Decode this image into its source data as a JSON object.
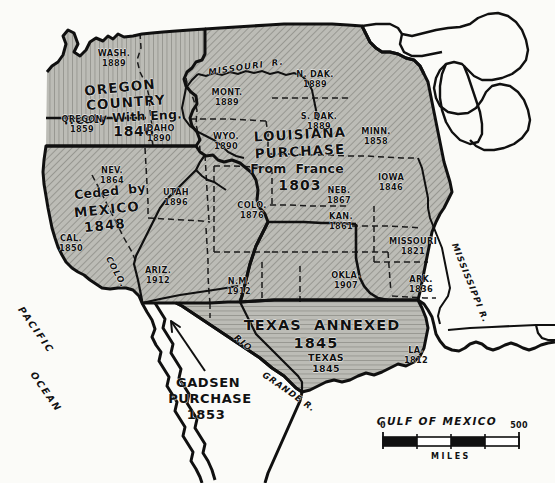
{
  "map": {
    "title": "United States Territorial Expansion",
    "colors": {
      "ink": "#111111",
      "paper": "#fdfdfb",
      "land_fill": "#b9b9b4",
      "ocean_fill": "#f4f4f0"
    },
    "territories": [
      {
        "id": "oregon-country",
        "lines": [
          "OREGON",
          "COUNTRY"
        ],
        "sub": "Treaty With Eng.",
        "year": "1846"
      },
      {
        "id": "mexican-cession",
        "lines": [
          "Ceded  by",
          "MEXICO"
        ],
        "year": "1848"
      },
      {
        "id": "louisiana-purchase",
        "lines": [
          "LOUISIANA",
          "PURCHASE"
        ],
        "sub": "From  France",
        "year": "1803"
      },
      {
        "id": "texas-annexation",
        "lines": [
          "TEXAS  ANNEXED"
        ],
        "year": "1845"
      },
      {
        "id": "gadsden-purchase",
        "lines": [
          "GADSEN",
          "PURCHASE"
        ],
        "year": "1853"
      }
    ],
    "states": [
      {
        "id": "wash",
        "name": "WASH.",
        "year": "1889",
        "x": 114,
        "y": 57
      },
      {
        "id": "oregon",
        "name": "OREGON",
        "year": "1859",
        "x": 82,
        "y": 123
      },
      {
        "id": "idaho",
        "name": "IDAHO",
        "year": "1890",
        "x": 158,
        "y": 130
      },
      {
        "id": "mont",
        "name": "MONT.",
        "year": "1889",
        "x": 226,
        "y": 95
      },
      {
        "id": "wyo",
        "name": "WYO.",
        "year": "1890",
        "x": 225,
        "y": 139
      },
      {
        "id": "ndak",
        "name": "N. DAK.",
        "year": "1889",
        "x": 314,
        "y": 78
      },
      {
        "id": "sdak",
        "name": "S. DAK.",
        "year": "1889",
        "x": 318,
        "y": 118
      },
      {
        "id": "minn",
        "name": "MINN.",
        "year": "1858",
        "x": 375,
        "y": 133
      },
      {
        "id": "iowa",
        "name": "IOWA",
        "year": "1846",
        "x": 390,
        "y": 180
      },
      {
        "id": "neb",
        "name": "NEB.",
        "year": "1867",
        "x": 338,
        "y": 193
      },
      {
        "id": "kan",
        "name": "KAN.",
        "year": "1861",
        "x": 340,
        "y": 218
      },
      {
        "id": "colo",
        "name": "COLO.",
        "year": "1876",
        "x": 251,
        "y": 207
      },
      {
        "id": "nev",
        "name": "NEV.",
        "year": "1864",
        "x": 111,
        "y": 172
      },
      {
        "id": "utah",
        "name": "UTAH",
        "year": "1896",
        "x": 175,
        "y": 194
      },
      {
        "id": "cal",
        "name": "CAL.",
        "year": "1850",
        "x": 70,
        "y": 240
      },
      {
        "id": "ariz",
        "name": "ARIZ.",
        "year": "1912",
        "x": 157,
        "y": 273
      },
      {
        "id": "nm",
        "name": "N.M.",
        "year": "1912",
        "x": 238,
        "y": 283
      },
      {
        "id": "okla",
        "name": "OKLA.",
        "year": "1907",
        "x": 345,
        "y": 277
      },
      {
        "id": "missouri",
        "name": "MISSOURI",
        "year": "1821",
        "x": 412,
        "y": 243
      },
      {
        "id": "ark",
        "name": "ARK.",
        "year": "1836",
        "x": 420,
        "y": 281
      },
      {
        "id": "la",
        "name": "LA.",
        "year": "1812",
        "x": 415,
        "y": 352
      },
      {
        "id": "texas",
        "name": "TEXAS",
        "year": "1845",
        "x": 325,
        "y": 360
      }
    ],
    "water_labels": [
      {
        "id": "pacific-ocean",
        "line1": "PACIFIC",
        "line2": "OCEAN"
      },
      {
        "id": "gulf-of-mexico",
        "text": "GULF OF MEXICO"
      },
      {
        "id": "missouri-river",
        "text": "MISSOURI  R."
      },
      {
        "id": "mississippi-river",
        "text": "MISSISSIPPI R."
      },
      {
        "id": "colorado-river",
        "text": "COLO."
      },
      {
        "id": "rio-grande-rio",
        "text": "RIO"
      },
      {
        "id": "rio-grande-grande",
        "text": "GRANDE R."
      }
    ],
    "scale": {
      "start": "0",
      "end": "500",
      "unit": "MILES"
    }
  }
}
